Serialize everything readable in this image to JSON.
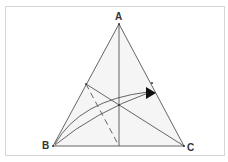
{
  "diagram": {
    "type": "geometric-triangle",
    "vertices": {
      "A": {
        "label": "A",
        "x": 119,
        "y": 24
      },
      "B": {
        "label": "B",
        "x": 53,
        "y": 146
      },
      "C": {
        "label": "C",
        "x": 184,
        "y": 146
      }
    },
    "points": {
      "foot_of_altitude": {
        "x": 119,
        "y": 146
      },
      "point_on_AB": {
        "x": 86,
        "y": 84
      },
      "intersection": {
        "x": 119,
        "y": 105
      },
      "point_on_AC": {
        "x": 152,
        "y": 83
      },
      "arrow_tip": {
        "x": 154,
        "y": 93
      }
    },
    "segments": [
      {
        "name": "side-AB",
        "from": "A",
        "to": "B",
        "style": "solid"
      },
      {
        "name": "side-AC",
        "from": "A",
        "to": "C",
        "style": "solid"
      },
      {
        "name": "side-BC",
        "from": "B",
        "to": "C",
        "style": "solid"
      },
      {
        "name": "altitude-from-A",
        "from": "A",
        "to": "foot_of_altitude",
        "style": "solid"
      },
      {
        "name": "cevian-to-C",
        "from": "point_on_AB",
        "to": "C",
        "style": "solid"
      },
      {
        "name": "dashed-segment",
        "from": "point_on_AB",
        "to": "foot_of_altitude",
        "style": "dashed"
      }
    ],
    "arrows": [
      {
        "name": "rotation-arrow",
        "from": "B",
        "to": "arrow_tip",
        "style": "curved-double"
      }
    ],
    "colors": {
      "stroke": "#555555",
      "fill": "#f4f4f4",
      "label": "#333333",
      "frame": "#d6d6d6"
    }
  }
}
